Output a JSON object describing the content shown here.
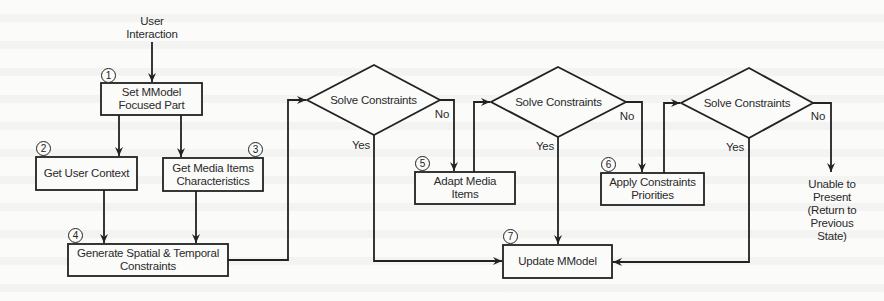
{
  "diagram": {
    "type": "flowchart",
    "start_label": "User\nInteraction",
    "nodes": [
      {
        "id": "n1",
        "number": "1",
        "kind": "process",
        "label": "Set MModel\nFocused Part"
      },
      {
        "id": "n2",
        "number": "2",
        "kind": "process",
        "label": "Get User Context"
      },
      {
        "id": "n3",
        "number": "3",
        "kind": "process",
        "label": "Get Media Items\nCharacteristics"
      },
      {
        "id": "n4",
        "number": "4",
        "kind": "process",
        "label": "Generate Spatial & Temporal\nConstraints"
      },
      {
        "id": "d1",
        "kind": "decision",
        "label": "Solve Constraints"
      },
      {
        "id": "n5",
        "number": "5",
        "kind": "process",
        "label": "Adapt Media\nItems"
      },
      {
        "id": "d2",
        "kind": "decision",
        "label": "Solve Constraints"
      },
      {
        "id": "n6",
        "number": "6",
        "kind": "process",
        "label": "Apply Constraints\nPriorities"
      },
      {
        "id": "d3",
        "kind": "decision",
        "label": "Solve Constraints"
      },
      {
        "id": "n7",
        "number": "7",
        "kind": "process",
        "label": "Update MModel"
      },
      {
        "id": "end",
        "kind": "terminal-text",
        "label": "Unable to\nPresent\n(Return to\nPrevious\nState)"
      }
    ],
    "edges": [
      {
        "from": "start",
        "to": "n1"
      },
      {
        "from": "n1",
        "to": "n2"
      },
      {
        "from": "n1",
        "to": "n3"
      },
      {
        "from": "n2",
        "to": "n4"
      },
      {
        "from": "n3",
        "to": "n4"
      },
      {
        "from": "n4",
        "to": "d1"
      },
      {
        "from": "d1",
        "to": "n7",
        "label": "Yes"
      },
      {
        "from": "d1",
        "to": "n5",
        "label": "No"
      },
      {
        "from": "n5",
        "to": "d2"
      },
      {
        "from": "d2",
        "to": "n7",
        "label": "Yes"
      },
      {
        "from": "d2",
        "to": "n6",
        "label": "No"
      },
      {
        "from": "n6",
        "to": "d3"
      },
      {
        "from": "d3",
        "to": "n7",
        "label": "Yes"
      },
      {
        "from": "d3",
        "to": "end",
        "label": "No"
      }
    ],
    "edge_labels": {
      "yes": "Yes",
      "no": "No"
    }
  },
  "colors": {
    "stroke": "#222222",
    "text": "#2a2a2a",
    "background": "#fbfbfa"
  }
}
